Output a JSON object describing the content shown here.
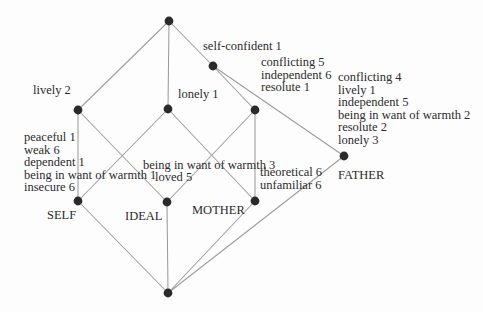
{
  "figure": {
    "width": 483,
    "height": 312,
    "background": "#fdfdfd",
    "line_color": "#9c9c9c",
    "node_color": "#2a2a2a",
    "text_color": "#2b2b2b",
    "node_radius": 4.4,
    "edge_width": 1.05,
    "font_size": 12.5,
    "line_height": 12.6
  },
  "lattice": {
    "nodes": [
      {
        "id": "top",
        "x": 169,
        "y": 21
      },
      {
        "id": "self-confident",
        "x": 213,
        "y": 66
      },
      {
        "id": "lively",
        "x": 78,
        "y": 110
      },
      {
        "id": "lonely",
        "x": 168,
        "y": 109
      },
      {
        "id": "conflicting",
        "x": 255,
        "y": 110
      },
      {
        "id": "father",
        "x": 344,
        "y": 156
      },
      {
        "id": "self",
        "x": 78,
        "y": 201
      },
      {
        "id": "ideal",
        "x": 167,
        "y": 202
      },
      {
        "id": "mother",
        "x": 255,
        "y": 201
      },
      {
        "id": "bottom",
        "x": 168,
        "y": 293
      }
    ],
    "edges": [
      {
        "from": "top",
        "to": "lively"
      },
      {
        "from": "top",
        "to": "lonely"
      },
      {
        "from": "top",
        "to": "self-confident"
      },
      {
        "from": "self-confident",
        "to": "conflicting"
      },
      {
        "from": "self-confident",
        "to": "father"
      },
      {
        "from": "lively",
        "to": "self"
      },
      {
        "from": "lively",
        "to": "ideal"
      },
      {
        "from": "lonely",
        "to": "self"
      },
      {
        "from": "lonely",
        "to": "mother"
      },
      {
        "from": "conflicting",
        "to": "ideal"
      },
      {
        "from": "conflicting",
        "to": "mother"
      },
      {
        "from": "father",
        "to": "bottom"
      },
      {
        "from": "self",
        "to": "bottom"
      },
      {
        "from": "ideal",
        "to": "bottom"
      },
      {
        "from": "mother",
        "to": "bottom"
      }
    ],
    "labels": [
      {
        "name": "label-self-confident-attributes",
        "x": 203,
        "y": 40,
        "lines": [
          "self-confident 1"
        ]
      },
      {
        "name": "label-conflicting-node-attributes",
        "x": 261,
        "y": 56,
        "lines": [
          "conflicting 5",
          "independent 6",
          "resolute 1"
        ]
      },
      {
        "name": "label-father-attributes",
        "x": 338,
        "y": 71,
        "lines": [
          "conflicting 4",
          "lively 1",
          "independent 5",
          "being in want of warmth 2",
          "resolute 2",
          "lonely 3"
        ]
      },
      {
        "name": "label-lively-attributes",
        "x": 33,
        "y": 84,
        "lines": [
          "lively 2"
        ]
      },
      {
        "name": "label-lonely-attributes",
        "x": 178,
        "y": 88,
        "lines": [
          "lonely 1"
        ]
      },
      {
        "name": "label-self-attributes",
        "x": 24,
        "y": 131,
        "lines": [
          "peaceful 1",
          "weak 6",
          "dependent 1",
          "being in want of warmth 1",
          "insecure 6"
        ]
      },
      {
        "name": "label-ideal-attributes-line1",
        "x": 143,
        "y": 159,
        "lines": [
          "being in want of warmth 3"
        ]
      },
      {
        "name": "label-ideal-attributes-line2",
        "x": 155,
        "y": 171,
        "lines": [
          "loved 5"
        ]
      },
      {
        "name": "label-mother-attributes",
        "x": 260,
        "y": 166,
        "lines": [
          "theoretical 6",
          "unfamiliar 6"
        ]
      },
      {
        "name": "label-object-self",
        "x": 47,
        "y": 209,
        "lines": [
          "SELF"
        ]
      },
      {
        "name": "label-object-ideal",
        "x": 125,
        "y": 210,
        "lines": [
          "IDEAL"
        ]
      },
      {
        "name": "label-object-mother",
        "x": 192,
        "y": 204,
        "lines": [
          "MOTHER"
        ]
      },
      {
        "name": "label-object-father",
        "x": 338,
        "y": 169,
        "lines": [
          "FATHER"
        ]
      }
    ]
  }
}
